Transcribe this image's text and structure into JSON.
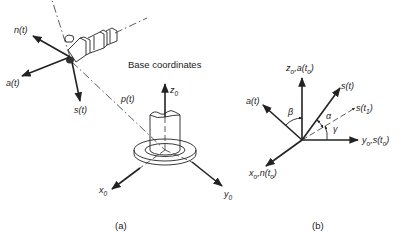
{
  "figure": {
    "panel_a": {
      "caption": "(a)",
      "title": "Base coordinates",
      "tool_frame": {
        "n_label": "n(t)",
        "a_label": "a(t)",
        "s_label": "s(t)",
        "p_label": "p(t)"
      },
      "base_frame": {
        "z_label": "z",
        "z_sub": "0",
        "x_label": "x",
        "x_sub": "0",
        "y_label": "y",
        "y_sub": "0"
      }
    },
    "panel_b": {
      "caption": "(b)",
      "axes": {
        "z_label_main": "z",
        "z_label_sub": "o",
        "z_label_rest": ",a(t",
        "z_label_sub2": "o",
        "z_label_end": ")",
        "y_label_main": "y",
        "y_label_sub": "o",
        "y_label_rest": ",s(t",
        "y_label_sub2": "o",
        "y_label_end": ")",
        "x_label_main": "x",
        "x_label_sub": "o",
        "x_label_rest": ",n(t",
        "x_label_sub2": "o",
        "x_label_end": ")",
        "a_label": "a(t)",
        "s_label": "s(t)",
        "s1_label_main": "s(t",
        "s1_label_sub": "1",
        "s1_label_end": ")"
      },
      "angles": {
        "beta": "β",
        "alpha": "α",
        "gamma": "γ"
      }
    }
  }
}
